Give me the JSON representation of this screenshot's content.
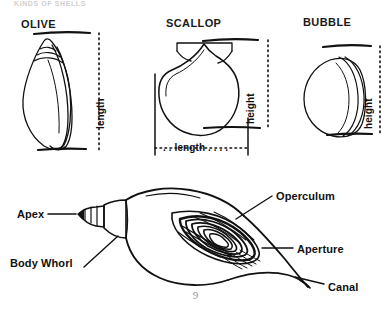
{
  "page": {
    "running_header": "KINDS OF SHELLS",
    "folio": "9",
    "ink_color": "#111111",
    "background_color": "#ffffff"
  },
  "specimens": [
    {
      "name": "olive-shell",
      "title": "OLIVE",
      "measurement_label": "length",
      "measurement_orientation": "vertical"
    },
    {
      "name": "scallop-shell",
      "title": "SCALLOP",
      "measurement_label": "height",
      "measurement_orientation": "vertical",
      "measurement_label_secondary": ". . length . . . .",
      "measurement_orientation_secondary": "horizontal"
    },
    {
      "name": "bubble-shell",
      "title": "BUBBLE",
      "measurement_label": "height",
      "measurement_orientation": "vertical"
    }
  ],
  "anatomy_diagram": {
    "name": "gastropod-shell-anatomy",
    "callouts": [
      {
        "key": "apex",
        "label": "Apex"
      },
      {
        "key": "body_whorl",
        "label": "Body Whorl"
      },
      {
        "key": "operculum",
        "label": "Operculum"
      },
      {
        "key": "aperture",
        "label": "Aperture"
      },
      {
        "key": "canal",
        "label": "Canal"
      }
    ]
  }
}
